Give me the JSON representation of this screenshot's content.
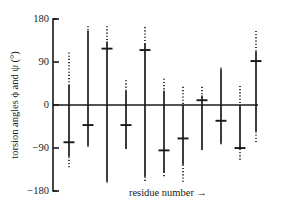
{
  "chart_data": {
    "type": "bar",
    "title": "",
    "subtitle": "",
    "xlabel": "residue number  →",
    "ylabel": "torsion angles ϕ and ψ (°)",
    "ylim": [
      -180,
      180
    ],
    "ytick_labels": [
      "180",
      "90",
      "0",
      "−90",
      "−180"
    ],
    "ytick_values": [
      180,
      90,
      0,
      -90,
      -180
    ],
    "xlim": [
      0,
      11
    ],
    "xtick_labels": [],
    "grid": false,
    "legend": null,
    "zero_reference_line": 0,
    "categories": [
      "1",
      "2",
      "3",
      "4",
      "5",
      "6",
      "7",
      "8",
      "9",
      "10",
      "11"
    ],
    "values": [
      -78,
      -42,
      118,
      -42,
      115,
      -95,
      -70,
      10,
      -33,
      92,
      92
    ],
    "series": [
      {
        "name": "mean torsion angle",
        "values": [
          -78,
          -42,
          118,
          -42,
          115,
          -95,
          -70,
          10,
          -33,
          92,
          92
        ]
      },
      {
        "name": "solid range top",
        "values": [
          42,
          155,
          133,
          30,
          130,
          30,
          0,
          20,
          75,
          180,
          180
        ]
      },
      {
        "name": "solid range bottom",
        "values": [
          -108,
          -85,
          -160,
          -90,
          -150,
          -140,
          -125,
          -92,
          -80,
          -40,
          -40
        ]
      },
      {
        "name": "dotted range top",
        "values": [
          110,
          165,
          165,
          52,
          165,
          55,
          38,
          38,
          75,
          155,
          155
        ]
      },
      {
        "name": "dotted range bottom",
        "values": [
          -135,
          -85,
          -162,
          -90,
          -160,
          -150,
          -165,
          -95,
          -80,
          -80,
          -80
        ]
      }
    ],
    "columns": [
      {
        "index": 1,
        "x": 69,
        "mean": -78,
        "solid_top": 42,
        "solid_bottom": -108,
        "dotted_top": 110,
        "dotted_bottom": -135
      },
      {
        "index": 2,
        "x": 88,
        "mean": -42,
        "solid_top": 155,
        "solid_bottom": -85,
        "dotted_top": 165,
        "dotted_bottom": -88
      },
      {
        "index": 3,
        "x": 107,
        "mean": 118,
        "solid_top": 133,
        "solid_bottom": -160,
        "dotted_top": 165,
        "dotted_bottom": -163
      },
      {
        "index": 4,
        "x": 126,
        "mean": -42,
        "solid_top": 30,
        "solid_bottom": -90,
        "dotted_top": 52,
        "dotted_bottom": -93
      },
      {
        "index": 5,
        "x": 145,
        "mean": 115,
        "solid_top": 130,
        "solid_bottom": -150,
        "dotted_top": 163,
        "dotted_bottom": -160
      },
      {
        "index": 6,
        "x": 164,
        "mean": -95,
        "solid_top": 30,
        "solid_bottom": -140,
        "dotted_top": 55,
        "dotted_bottom": -152
      },
      {
        "index": 7,
        "x": 183,
        "mean": -70,
        "solid_top": 0,
        "solid_bottom": -125,
        "dotted_top": 38,
        "dotted_bottom": -165
      },
      {
        "index": 8,
        "x": 202,
        "mean": 10,
        "solid_top": 20,
        "solid_bottom": -92,
        "dotted_top": 38,
        "dotted_bottom": -95
      },
      {
        "index": 9,
        "x": 221,
        "mean": -33,
        "solid_top": 75,
        "solid_bottom": -80,
        "dotted_top": 78,
        "dotted_bottom": -82
      },
      {
        "index": 10,
        "x": 240,
        "mean": -90,
        "solid_top": 0,
        "solid_bottom": -92,
        "dotted_top": 40,
        "dotted_bottom": -118
      },
      {
        "index": 11,
        "x": 256,
        "mean": 92,
        "solid_top": 112,
        "solid_bottom": -55,
        "dotted_top": 155,
        "dotted_bottom": -80
      }
    ]
  },
  "axis": {
    "y_title": "torsion angles ϕ and ψ (°)",
    "x_title": "residue number  →",
    "ticks": [
      {
        "label": "180",
        "value": 180
      },
      {
        "label": "90",
        "value": 90
      },
      {
        "label": "0",
        "value": 0
      },
      {
        "label": "−90",
        "value": -90
      },
      {
        "label": "−180",
        "value": -180
      }
    ]
  },
  "colors": {
    "ink": "#1a1a1a",
    "background": "#ffffff"
  }
}
